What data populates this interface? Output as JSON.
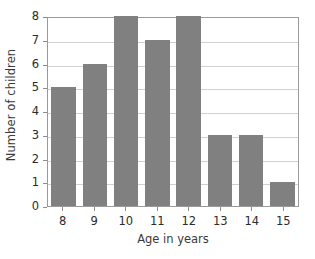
{
  "chart_data": {
    "type": "bar",
    "title": "",
    "subtitle": "",
    "xlabel": "Age in years",
    "ylabel": "Number of children",
    "categories": [
      "8",
      "9",
      "10",
      "11",
      "12",
      "13",
      "14",
      "15"
    ],
    "values": [
      5,
      6,
      8,
      7,
      8,
      3,
      3,
      1
    ],
    "ylim": [
      0,
      8
    ],
    "ytick_labels": [
      "0",
      "1",
      "2",
      "3",
      "4",
      "5",
      "6",
      "7",
      "8"
    ],
    "ytick_values": [
      0,
      1,
      2,
      3,
      4,
      5,
      6,
      7,
      8
    ],
    "grid": true,
    "grid_axis": "y",
    "legend": false,
    "legend_position": "none",
    "series": [
      {
        "name": "Number of children",
        "values": [
          5,
          6,
          8,
          7,
          8,
          3,
          3,
          1
        ]
      }
    ],
    "colors": {
      "bar_fill": "#808080",
      "background": "#ffffff",
      "axis": "#9a9a9a",
      "gridline": "#d0d0d0",
      "text": "#2b2b2b"
    },
    "annotations": []
  }
}
